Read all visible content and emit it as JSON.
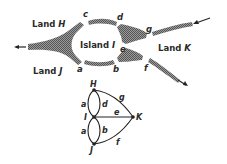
{
  "map": {
    "lands": [
      {
        "id": "H",
        "label": "Land",
        "name": "H"
      },
      {
        "id": "I",
        "label": "Island",
        "name": "I"
      },
      {
        "id": "J",
        "label": "Land",
        "name": "J"
      },
      {
        "id": "K",
        "label": "Land",
        "name": "K"
      }
    ],
    "bridges": [
      "a",
      "b",
      "c",
      "d",
      "e",
      "f",
      "g"
    ]
  },
  "graph": {
    "nodes": [
      "H",
      "I",
      "J",
      "K"
    ],
    "edges": [
      {
        "label": "a",
        "from": "H",
        "to": "I"
      },
      {
        "label": "d",
        "from": "H",
        "to": "I"
      },
      {
        "label": "a",
        "from": "I",
        "to": "J"
      },
      {
        "label": "b",
        "from": "I",
        "to": "J"
      },
      {
        "label": "e",
        "from": "I",
        "to": "K"
      },
      {
        "label": "g",
        "from": "H",
        "to": "K"
      },
      {
        "label": "f",
        "from": "J",
        "to": "K"
      }
    ]
  },
  "colors": {
    "ink": "#2a2a2a",
    "river": "#8a8a8a"
  }
}
